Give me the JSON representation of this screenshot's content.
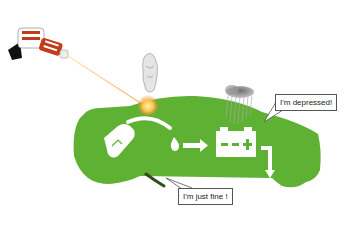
{
  "illustration": {
    "colors": {
      "car_green": "#5fb133",
      "beam": "#f7c35a",
      "gun_red": "#c23b1a",
      "cloud": "#8a8a8a"
    },
    "icons": [
      "ray-gun-icon",
      "ghost-figure-icon",
      "rain-cloud-icon",
      "fuel-pump-icon",
      "drop-icon",
      "arrow-right-icon",
      "battery-icon",
      "exhaust-pipe-icon"
    ],
    "battery_symbols": {
      "minus": "−",
      "plus": "+"
    }
  },
  "bubbles": {
    "depressed": "I'm depressed!",
    "fine": "I'm just fine !"
  }
}
